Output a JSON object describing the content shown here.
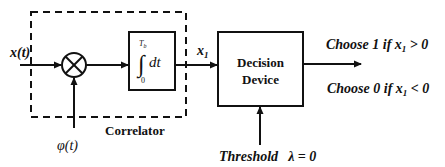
{
  "diagram": {
    "type": "block-diagram",
    "input_signal": {
      "label": "x(t)"
    },
    "multiplier": {
      "symbol": "⊗",
      "reference_signal": "φ(t)"
    },
    "integrator": {
      "upper_limit": "T",
      "upper_limit_sub": "b",
      "lower_limit": "0",
      "integral_sign": "∫",
      "differential": "dt"
    },
    "correlator_group": {
      "label": "Correlator"
    },
    "correlator_output": {
      "label_main": "x",
      "label_sub": "1"
    },
    "decision_device": {
      "line1": "Decision",
      "line2": "Device"
    },
    "threshold": {
      "label": "Threshold",
      "expression": "λ = 0"
    },
    "decision_rules": [
      {
        "prefix": "Choose 1 if ",
        "var": "x",
        "sub": "1",
        "suffix": " > 0"
      },
      {
        "prefix": "Choose 0 if ",
        "var": "x",
        "sub": "1",
        "suffix": " < 0"
      }
    ],
    "colors": {
      "stroke": "#111111",
      "background": "#ffffff"
    }
  }
}
